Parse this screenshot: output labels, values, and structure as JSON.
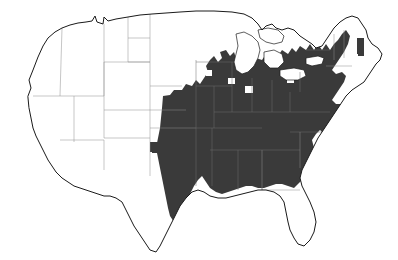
{
  "figure": {
    "type": "choropleth-range-map",
    "projection": "contiguous-united-states",
    "caption": ""
  },
  "legend": {
    "shaded_label": "Present",
    "unshaded_label": "Absent",
    "shaded_color": "#3a3a3a",
    "unshaded_color": "#ffffff",
    "outline_color": "#1a1a1a",
    "state_border_color": "#8d8d8d"
  },
  "map_data": {
    "type": "map",
    "unit": "county",
    "shaded_regions": [
      "Maine",
      "Vermont",
      "New York",
      "Pennsylvania",
      "New Jersey",
      "Delaware",
      "Maryland",
      "West Virginia",
      "Virginia",
      "North Carolina",
      "Ohio",
      "Michigan",
      "Indiana",
      "Illinois",
      "Wisconsin",
      "Iowa",
      "Missouri",
      "Kentucky",
      "Tennessee",
      "Arkansas",
      "Louisiana",
      "Mississippi",
      "Alabama",
      "Nebraska",
      "Kansas",
      "Oklahoma",
      "Texas",
      "Minnesota",
      "Florida"
    ],
    "unshaded_regions": [
      "Washington",
      "Oregon",
      "California",
      "Idaho",
      "Nevada",
      "Utah",
      "Arizona",
      "Montana",
      "Wyoming",
      "Colorado",
      "New Mexico",
      "North Dakota",
      "South Dakota",
      "Georgia",
      "South Carolina",
      "New Hampshire",
      "Massachusetts",
      "Connecticut",
      "Rhode Island"
    ],
    "notes": [
      "Continuous shading covers the eastern and south-central United States",
      "Western states are entirely unshaded",
      "Isolated shaded patches occur in western Texas and the Texas panhandle",
      "Central Florida peninsula is shaded; the panhandle is not",
      "Georgia and South Carolina are largely unshaded with one small patch",
      "Northern New England and the Michigan upper peninsula are unshaded"
    ]
  }
}
